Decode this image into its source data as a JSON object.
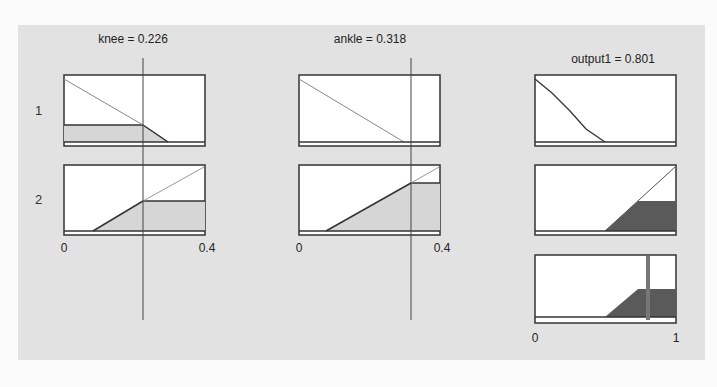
{
  "figure": {
    "type": "fuzzy-inference-rule-viewer",
    "inputs": [
      {
        "name": "knee",
        "value": "0.226",
        "title": "knee = 0.226",
        "range": [
          0,
          0.4
        ],
        "tick_min": "0",
        "tick_max": "0.4"
      },
      {
        "name": "ankle",
        "value": "0.318",
        "title": "ankle = 0.318",
        "range": [
          0,
          0.4
        ],
        "tick_min": "0",
        "tick_max": "0.4"
      }
    ],
    "output": {
      "name": "output1",
      "value": "0.801",
      "title": "output1 = 0.801",
      "range": [
        0,
        1
      ],
      "tick_min": "0",
      "tick_max": "1"
    },
    "rules": [
      {
        "number": "1",
        "knee_mf": "decreasing ramp",
        "ankle_mf": "decreasing ramp",
        "output_mf": "decreasing ramp",
        "firing_strength": 0.0
      },
      {
        "number": "2",
        "knee_mf": "increasing ramp",
        "ankle_mf": "increasing ramp",
        "output_mf": "increasing ramp",
        "firing_strength": 0.55
      }
    ],
    "colors": {
      "background": "#e2e2e2",
      "panel": "#ffffff",
      "input_fill": "#d6d6d6",
      "output_fill": "#5a5a5a",
      "line": "#333333",
      "centroid": "#777777"
    }
  }
}
